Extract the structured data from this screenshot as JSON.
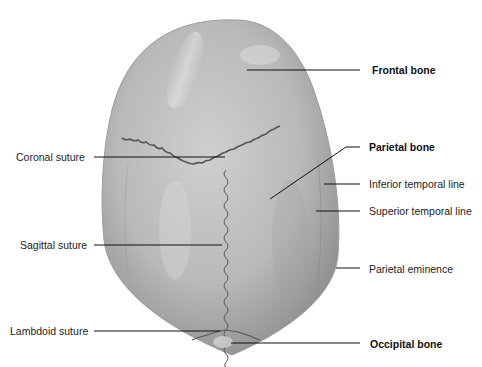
{
  "figure": {
    "colors": {
      "bone": "#b8b8b8",
      "bone_light": "#d6d6d6",
      "bone_dark": "#8f8f8f",
      "suture": "#555555",
      "leader": "#111111",
      "background": "#ffffff"
    }
  },
  "labels": {
    "left": [
      {
        "id": "coronal-suture",
        "text": "Coronal suture",
        "bold": false
      },
      {
        "id": "sagittal-suture",
        "text": "Sagittal suture",
        "bold": false
      },
      {
        "id": "lambdoid-suture",
        "text": "Lambdoid suture",
        "bold": false
      }
    ],
    "right": [
      {
        "id": "frontal-bone",
        "text": "Frontal bone",
        "bold": true
      },
      {
        "id": "parietal-bone",
        "text": "Parietal bone",
        "bold": true
      },
      {
        "id": "inferior-temporal-line",
        "text": "Inferior temporal line",
        "bold": false
      },
      {
        "id": "superior-temporal-line",
        "text": "Superior temporal line",
        "bold": false
      },
      {
        "id": "parietal-eminence",
        "text": "Parietal eminence",
        "bold": false
      },
      {
        "id": "occipital-bone",
        "text": "Occipital bone",
        "bold": true
      }
    ]
  }
}
